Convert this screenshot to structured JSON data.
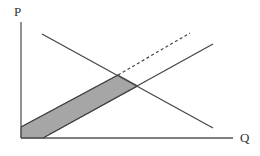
{
  "diagram": {
    "type": "supply-demand",
    "axes": {
      "y_label": "P",
      "x_label": "Q"
    },
    "lines": [
      {
        "name": "demand",
        "style": "solid",
        "from": [
          42,
          34
        ],
        "to": [
          213,
          128
        ]
      },
      {
        "name": "supply",
        "style": "solid",
        "from": [
          43,
          138
        ],
        "to": [
          213,
          44
        ]
      },
      {
        "name": "supply-shifted",
        "style": "dashed",
        "from": [
          21,
          127
        ],
        "to": [
          190,
          33
        ]
      }
    ],
    "shaded_region": {
      "fill": "#a6a6a6",
      "points": [
        [
          21,
          127
        ],
        [
          21,
          138
        ],
        [
          43,
          138
        ],
        [
          138,
          86
        ],
        [
          118,
          75
        ]
      ]
    },
    "colors": {
      "line": "#444444",
      "axis": "#555555",
      "fill": "#a6a6a6"
    }
  }
}
